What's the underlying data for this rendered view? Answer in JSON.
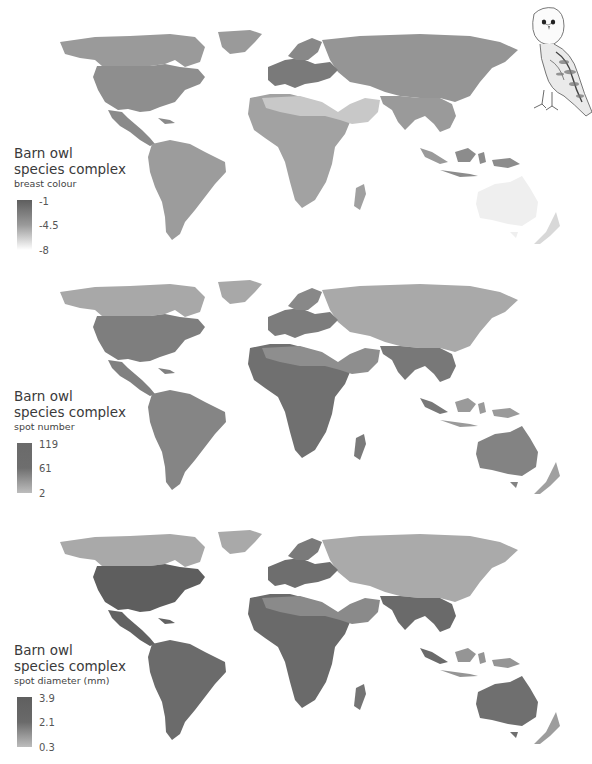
{
  "figure": {
    "subject": "Barn owl species complex",
    "illustration": "barn-owl-drawing"
  },
  "panels": [
    {
      "id": "breast-colour",
      "legend": {
        "title_line1": "Barn owl",
        "title_line2": "species complex",
        "variable": "breast colour",
        "max_label": "-1",
        "mid_label": "-4.5",
        "min_label": "-8",
        "gradient_top": "#5e5e5e",
        "gradient_bottom": "#ffffff"
      },
      "fills": {
        "north_america_north": "#9a9a9a",
        "north_america_south": "#8e8e8e",
        "greenland": "#9a9a9a",
        "central_america": "#8a8a8a",
        "south_america": "#9c9c9c",
        "europe": "#7a7a7a",
        "scandinavia": "#888888",
        "russia_asia": "#959595",
        "africa": "#a2a2a2",
        "sahara_middle_east": "#c8c8c8",
        "india_se_asia": "#9a9a9a",
        "indonesia": "#8c8c8c",
        "madagascar": "#a0a0a0",
        "australia": "#efefef",
        "new_zealand": "#d8d8d8"
      }
    },
    {
      "id": "spot-number",
      "legend": {
        "title_line1": "Barn owl",
        "title_line2": "species complex",
        "variable": "spot number",
        "max_label": "119",
        "mid_label": "61",
        "min_label": "2",
        "gradient_top": "#6a6a6a",
        "gradient_bottom": "#bdbdbd"
      },
      "fills": {
        "north_america_north": "#a8a8a8",
        "north_america_south": "#7e7e7e",
        "greenland": "#a8a8a8",
        "central_america": "#808080",
        "south_america": "#858585",
        "europe": "#7c7c7c",
        "scandinavia": "#888888",
        "russia_asia": "#a9a9a9",
        "africa": "#707070",
        "sahara_middle_east": "#8e8e8e",
        "india_se_asia": "#787878",
        "indonesia": "#9a9a9a",
        "madagascar": "#7a7a7a",
        "australia": "#838383",
        "new_zealand": "#a0a0a0"
      }
    },
    {
      "id": "spot-diameter",
      "legend": {
        "title_line1": "Barn owl",
        "title_line2": "species complex",
        "variable": "spot diameter (mm)",
        "max_label": "3.9",
        "mid_label": "2.1",
        "min_label": "0.3",
        "gradient_top": "#5f5f5f",
        "gradient_bottom": "#bdbdbd"
      },
      "fills": {
        "north_america_north": "#a9a9a9",
        "north_america_south": "#5e5e5e",
        "greenland": "#a9a9a9",
        "central_america": "#626262",
        "south_america": "#6b6b6b",
        "europe": "#6e6e6e",
        "scandinavia": "#7a7a7a",
        "russia_asia": "#aaaaaa",
        "africa": "#6a6a6a",
        "sahara_middle_east": "#8a8a8a",
        "india_se_asia": "#6a6a6a",
        "indonesia": "#959595",
        "madagascar": "#747474",
        "australia": "#6f6f6f",
        "new_zealand": "#9d9d9d"
      }
    }
  ]
}
